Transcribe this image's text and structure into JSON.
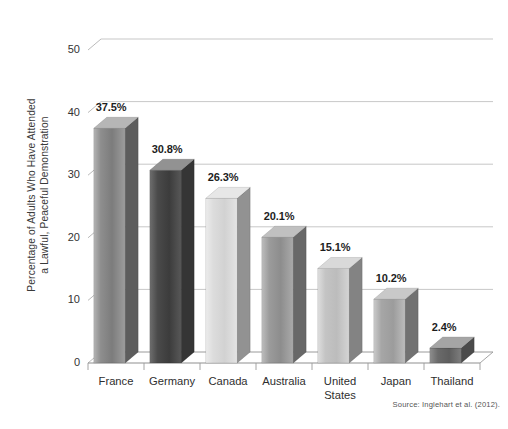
{
  "chart_data": {
    "type": "bar",
    "title": "",
    "xlabel": "",
    "ylabel": "Percentage of Adults Who Have Attended a Lawful, Peaceful Demonstration",
    "ylabel_lines": [
      "Percentage of Adults Who Have Attended",
      "a Lawful, Peaceful Demonstration"
    ],
    "categories": [
      "France",
      "Germany",
      "Canada",
      "Australia",
      "United States",
      "Japan",
      "Thailand"
    ],
    "values": [
      37.5,
      30.8,
      26.3,
      20.1,
      15.1,
      10.2,
      2.4
    ],
    "value_labels": [
      "37.5%",
      "30.8%",
      "26.3%",
      "20.1%",
      "15.1%",
      "10.2%",
      "2.4%"
    ],
    "ylim": [
      0,
      50
    ],
    "y_ticks": [
      0,
      10,
      20,
      30,
      40,
      50
    ],
    "y_tick_labels": [
      "0",
      "10",
      "20",
      "30",
      "40",
      "50"
    ],
    "grid": true,
    "legend": "none",
    "style": "3d-bars-grayscale",
    "bar_colors": [
      "#8a8a8a",
      "#4f4f4f",
      "#d8d8d8",
      "#9a9a9a",
      "#c2c2c2",
      "#a8a8a8",
      "#6f6f6f"
    ]
  },
  "annotations": {
    "source": "Source: Inglehart et al. (2012)."
  }
}
